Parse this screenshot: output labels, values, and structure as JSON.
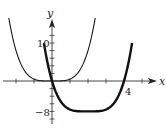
{
  "chart_data": {
    "type": "line",
    "title": "",
    "xlabel": "x",
    "ylabel": "y",
    "x_tick_labels": [
      {
        "value": 4,
        "label": "4"
      }
    ],
    "y_tick_labels": [
      {
        "value": 10,
        "label": "10"
      },
      {
        "value": -8,
        "label": "−8"
      }
    ],
    "x_ticks": [
      -2,
      -1,
      0,
      1,
      2,
      3,
      4,
      5
    ],
    "y_ticks": [
      -10,
      -8,
      -6,
      -4,
      -2,
      0,
      2,
      4,
      6,
      8,
      10,
      12
    ],
    "xlim": [
      -2.9,
      5.9
    ],
    "ylim": [
      -11,
      17
    ],
    "grid": false,
    "legend": null,
    "series": [
      {
        "name": "thin curve",
        "expression": "y = x^4 / 2",
        "style": "thin",
        "x_range": [
          -2.4,
          2.4
        ],
        "points": [
          [
            -2.4,
            16.6
          ],
          [
            -2,
            8
          ],
          [
            -1.5,
            2.53
          ],
          [
            -1,
            0.5
          ],
          [
            -0.5,
            0.03
          ],
          [
            0,
            0
          ],
          [
            0.5,
            0.03
          ],
          [
            1,
            0.5
          ],
          [
            1.5,
            2.53
          ],
          [
            2,
            8
          ],
          [
            2.4,
            16.6
          ]
        ]
      },
      {
        "name": "thick curve",
        "expression": "y = (x - 2)^4 / 2 - 8",
        "style": "thick",
        "x_range": [
          -0.45,
          4.45
        ],
        "points": [
          [
            -0.45,
            10
          ],
          [
            0,
            0
          ],
          [
            0.5,
            -5.47
          ],
          [
            1,
            -7.5
          ],
          [
            1.5,
            -7.97
          ],
          [
            2,
            -8
          ],
          [
            2.5,
            -7.97
          ],
          [
            3,
            -7.5
          ],
          [
            3.5,
            -5.47
          ],
          [
            4,
            0
          ],
          [
            4.45,
            10
          ]
        ]
      }
    ],
    "annotations": [
      {
        "text": "4",
        "near": [
          4,
          0
        ]
      },
      {
        "text": "10",
        "near": [
          0,
          10
        ]
      },
      {
        "text": "−8",
        "near": [
          0,
          -8
        ]
      }
    ]
  },
  "labels": {
    "x_axis": "x",
    "y_axis": "y",
    "tick_4": "4",
    "tick_10": "10",
    "tick_neg8": "−8"
  }
}
